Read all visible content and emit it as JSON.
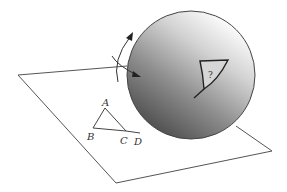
{
  "diagram": {
    "plane": {
      "stroke": "#555555"
    },
    "planar_triangle": {
      "vertices": {
        "A": "A",
        "B": "B",
        "C": "C",
        "D": "D"
      }
    },
    "sphere": {
      "fill_light": "#ffffff",
      "fill_dark": "#555555",
      "stroke": "#444444",
      "spherical_triangle_label": "?"
    },
    "arrows": {
      "rotation_arrow": "curved arrow up",
      "wrap_arrow": "curved arrow onto sphere"
    }
  }
}
